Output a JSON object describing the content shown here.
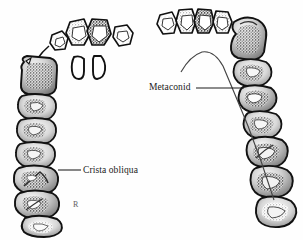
{
  "figure": {
    "background_color": "#fefefe",
    "ink_color": "#111111",
    "shade_color": "#8e8e8e",
    "width": 303,
    "height": 240
  },
  "labels": [
    {
      "id": "crista-obliqua",
      "text": "Crista obliqua",
      "leader": {
        "x1": 58,
        "y1": 170,
        "x2": 81,
        "y2": 170
      }
    },
    {
      "id": "metaconid",
      "text": "Metaconid",
      "leader": {
        "x1": 195,
        "y1": 88,
        "x2": 243,
        "y2": 88
      }
    }
  ],
  "signature": {
    "text": "R",
    "x": 73,
    "y": 200
  },
  "specimens": [
    {
      "id": "maxilla-left",
      "name": "upper-dental-arcade",
      "side": "left",
      "description": "Maxillary tooth row, occlusal view",
      "tooth_groups": [
        {
          "group": "incisors",
          "count": 4
        },
        {
          "group": "canine",
          "count": 1
        },
        {
          "group": "premolars",
          "count": 3
        },
        {
          "group": "molars",
          "count": 3
        }
      ]
    },
    {
      "id": "mandible-right",
      "name": "lower-dental-arcade",
      "side": "right",
      "description": "Mandibular tooth row, occlusal view with inner symphyseal border",
      "tooth_groups": [
        {
          "group": "incisors",
          "count": 4
        },
        {
          "group": "canine",
          "count": 1
        },
        {
          "group": "premolars",
          "count": 3
        },
        {
          "group": "molars",
          "count": 3
        }
      ]
    },
    {
      "id": "isolated-incisors",
      "name": "detached-incisor-pair",
      "description": "Two isolated incisor outlines",
      "tooth_groups": [
        {
          "group": "incisors",
          "count": 2
        }
      ]
    }
  ]
}
